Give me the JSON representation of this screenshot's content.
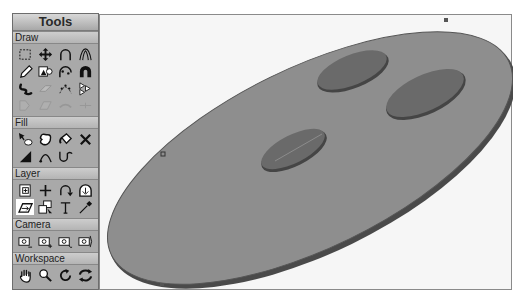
{
  "tools_panel": {
    "title": "Tools",
    "sections": [
      {
        "label": "Draw",
        "tools": [
          "rect-select",
          "move",
          "arc",
          "pointed-arc",
          "pencil",
          "shape-from-image",
          "bezier-edit",
          "magnet",
          "freehand-stroke",
          "eraser",
          "bezier-points",
          "distribute",
          "disabled-shape-1",
          "disabled-shape-2",
          "disabled-shape-3",
          "disabled-shape-4"
        ]
      },
      {
        "label": "Fill",
        "tools": [
          "fill-select",
          "blob",
          "paint-bucket",
          "delete-fill",
          "gradient",
          "fill-arc",
          "fill-curve"
        ]
      },
      {
        "label": "Layer",
        "tools": [
          "new-layer",
          "add",
          "rotate",
          "layer-warp",
          "plane-select",
          "layer-stack",
          "text",
          "eyedropper"
        ],
        "selected": "plane-select"
      },
      {
        "label": "Camera",
        "tools": [
          "camera-pan",
          "camera-dolly",
          "camera-rotate",
          "camera-roll"
        ]
      },
      {
        "label": "Workspace",
        "tools": [
          "hand",
          "zoom",
          "rotate-view",
          "reset-view"
        ]
      }
    ]
  },
  "canvas": {
    "object": "ellipse-disc",
    "colors": {
      "disc": "#8e8e8e",
      "disc_edge": "#4a4a4a",
      "holes": "#6a6a6a",
      "background": "#f6f6f6"
    }
  }
}
